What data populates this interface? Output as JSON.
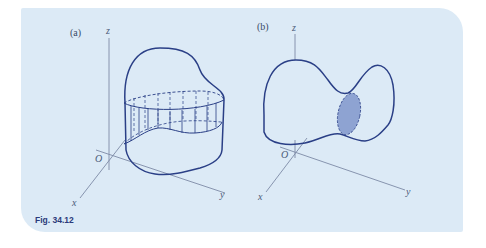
{
  "figure": {
    "caption": "Fig. 34.12",
    "panels": [
      {
        "label": "(a)",
        "axes": {
          "z": "z",
          "x": "x",
          "y": "y",
          "origin": "O"
        },
        "description": "Closed surface with a cylindrical band (dashed vertical rulings) cut out around it"
      },
      {
        "label": "(b)",
        "axes": {
          "z": "z",
          "x": "x",
          "y": "y",
          "origin": "O"
        },
        "description": "Closed dumbbell-shaped surface with a shaded elliptical cross-section at the waist"
      }
    ]
  },
  "colors": {
    "panel_bg": "#dceaf6",
    "curve": "#2a3f86",
    "axis": "#7d8aa6",
    "shade": "#8ea3d2",
    "caption": "#2b3a7a"
  }
}
